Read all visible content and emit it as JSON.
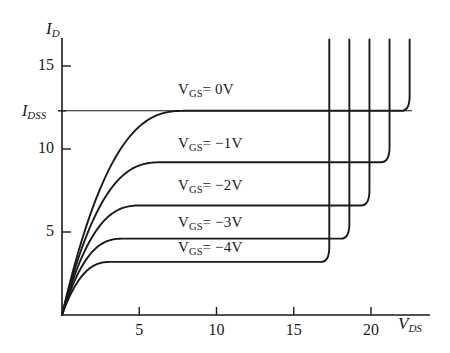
{
  "chart_data": {
    "type": "line",
    "title": "",
    "xlabel": "V_DS",
    "ylabel": "I_D",
    "xlabel_main": "V",
    "xlabel_sub": "DS",
    "ylabel_main": "I",
    "ylabel_sub": "D",
    "xlim": [
      0,
      25
    ],
    "ylim": [
      0,
      16.5
    ],
    "grid": false,
    "legend_position": "inline-on-curves",
    "xticks": [
      5,
      10,
      15,
      20
    ],
    "yticks": [
      5,
      10,
      15
    ],
    "special_yticks": [
      {
        "label_main": "I",
        "label_sub": "DSS",
        "value": 12.3
      }
    ],
    "annotations": [
      {
        "text": "I_DSS horizontal reference line at I_D = 12.3 mA",
        "type": "hline",
        "value": 12.3
      }
    ],
    "series": [
      {
        "name": "V_GS = 0V",
        "label_prefix": "V",
        "label_sub": "GS",
        "label_suffix": "= 0V",
        "vgs": 0,
        "saturation_current": 12.3,
        "knee_vds": 4.2,
        "breakdown_vds": 22.5,
        "label_x": 178,
        "label_y": 82
      },
      {
        "name": "V_GS = -1V",
        "label_prefix": "V",
        "label_sub": "GS",
        "label_suffix": "= −1V",
        "vgs": -1,
        "saturation_current": 9.2,
        "knee_vds": 3.4,
        "breakdown_vds": 21.2,
        "label_x": 178,
        "label_y": 136
      },
      {
        "name": "V_GS = -2V",
        "label_prefix": "V",
        "label_sub": "GS",
        "label_suffix": "= −2V",
        "vgs": -2,
        "saturation_current": 6.6,
        "knee_vds": 2.7,
        "breakdown_vds": 19.9,
        "label_x": 178,
        "label_y": 178
      },
      {
        "name": "V_GS = -3V",
        "label_prefix": "V",
        "label_sub": "GS",
        "label_suffix": "= −3V",
        "vgs": -3,
        "saturation_current": 4.6,
        "knee_vds": 2.1,
        "breakdown_vds": 18.6,
        "label_x": 178,
        "label_y": 215
      },
      {
        "name": "V_GS = -4V",
        "label_prefix": "V",
        "label_sub": "GS",
        "label_suffix": "= −4V",
        "vgs": -4,
        "saturation_current": 3.2,
        "knee_vds": 1.7,
        "breakdown_vds": 17.3,
        "label_x": 178,
        "label_y": 240
      }
    ]
  },
  "colors": {
    "ink": "#1a1a1a",
    "background": "#ffffff"
  }
}
